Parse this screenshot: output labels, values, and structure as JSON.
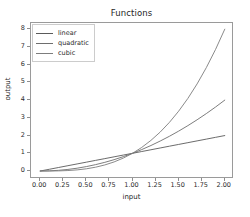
{
  "chart_data": {
    "type": "line",
    "title": "Functions",
    "xlabel": "input",
    "ylabel": "output",
    "xlim": [
      -0.1,
      2.1
    ],
    "ylim": [
      -0.45,
      8.35
    ],
    "grid": false,
    "legend_position": "upper left",
    "xticks": [
      "0.00",
      "0.25",
      "0.50",
      "0.75",
      "1.00",
      "1.25",
      "1.50",
      "1.75",
      "2.00"
    ],
    "xtick_values": [
      0,
      0.25,
      0.5,
      0.75,
      1.0,
      1.25,
      1.5,
      1.75,
      2.0
    ],
    "yticks": [
      "0",
      "1",
      "2",
      "3",
      "4",
      "5",
      "6",
      "7",
      "8"
    ],
    "ytick_values": [
      0,
      1,
      2,
      3,
      4,
      5,
      6,
      7,
      8
    ],
    "x": [
      0.0,
      0.1,
      0.2,
      0.3,
      0.4,
      0.5,
      0.6,
      0.7,
      0.8,
      0.9,
      1.0,
      1.1,
      1.2,
      1.3,
      1.4,
      1.5,
      1.6,
      1.7,
      1.8,
      1.9,
      2.0
    ],
    "series": [
      {
        "name": "linear",
        "color": "#5a5a5a",
        "values": [
          0.0,
          0.1,
          0.2,
          0.3,
          0.4,
          0.5,
          0.6,
          0.7,
          0.8,
          0.9,
          1.0,
          1.1,
          1.2,
          1.3,
          1.4,
          1.5,
          1.6,
          1.7,
          1.8,
          1.9,
          2.0
        ]
      },
      {
        "name": "quadratic",
        "color": "#6e6e6e",
        "values": [
          0.0,
          0.01,
          0.04,
          0.09,
          0.16,
          0.25,
          0.36,
          0.49,
          0.64,
          0.81,
          1.0,
          1.21,
          1.44,
          1.69,
          1.96,
          2.25,
          2.56,
          2.89,
          3.24,
          3.61,
          4.0
        ]
      },
      {
        "name": "cubic",
        "color": "#7d7d7d",
        "values": [
          0.0,
          0.001,
          0.008,
          0.027,
          0.064,
          0.125,
          0.216,
          0.343,
          0.512,
          0.729,
          1.0,
          1.331,
          1.728,
          2.197,
          2.744,
          3.375,
          4.096,
          4.913,
          5.832,
          6.859,
          8.0
        ]
      }
    ]
  },
  "figure": {
    "background": "#ffffff",
    "axes_edge_color": "#9a9a9a",
    "text_color": "#262626"
  }
}
